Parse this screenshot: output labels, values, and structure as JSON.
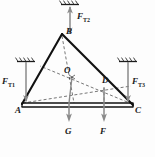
{
  "figure": {
    "type": "free-body-diagram",
    "caption": ""
  },
  "vertices": [
    {
      "id": "A",
      "label": "A",
      "x": 22,
      "y": 104
    },
    {
      "id": "B",
      "label": "B",
      "x": 62,
      "y": 34
    },
    {
      "id": "C",
      "label": "C",
      "x": 133,
      "y": 106
    },
    {
      "id": "O",
      "label": "O",
      "x": 72,
      "y": 75
    },
    {
      "id": "D",
      "label": "D",
      "x": 104,
      "y": 85
    }
  ],
  "forces": [
    {
      "id": "FT2",
      "label": "F",
      "sub": "T2",
      "direction": "up",
      "at": "B",
      "label_x": 70,
      "label_y": 12
    },
    {
      "id": "FT1",
      "label": "F",
      "sub": "T1",
      "direction": "down",
      "at": "A",
      "label_x": 2,
      "label_y": 77
    },
    {
      "id": "FT3",
      "label": "F",
      "sub": "T3",
      "direction": "down",
      "at": "C",
      "label_x": 128,
      "label_y": 77
    },
    {
      "id": "G",
      "label": "G",
      "sub": "",
      "direction": "down",
      "at": "O",
      "label_x": 64,
      "label_y": 133
    },
    {
      "id": "F",
      "label": "F",
      "sub": "",
      "direction": "down",
      "at": "D",
      "label_x": 98,
      "label_y": 133
    }
  ],
  "supports": [
    {
      "id": "support-top",
      "x": 70,
      "y": 3,
      "orientation": "horizontal"
    },
    {
      "id": "support-left",
      "x": 26,
      "y": 60,
      "orientation": "horizontal"
    },
    {
      "id": "support-right",
      "x": 128,
      "y": 60,
      "orientation": "horizontal"
    }
  ],
  "colors": {
    "line": "#1a1a1a",
    "dashed": "#555555",
    "arrow": "#7a7a7a",
    "background": "#fdfdfd"
  }
}
